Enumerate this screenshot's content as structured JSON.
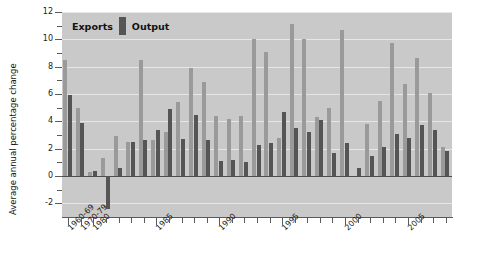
{
  "chart_data": {
    "type": "bar",
    "title": "",
    "xlabel": "",
    "ylabel": "Average annual percentage change",
    "ylim": [
      -3,
      12
    ],
    "yticks": [
      -2,
      0,
      2,
      4,
      6,
      8,
      10,
      12
    ],
    "ytick_labels": [
      "-2",
      "0",
      "2",
      "4",
      "6",
      "8",
      "10",
      "12"
    ],
    "grid": true,
    "legend_position": "top-left",
    "legend": [
      "Exports",
      "Output"
    ],
    "categories": [
      "1960-69",
      "1970-79",
      "1980",
      "1981",
      "1982",
      "1983",
      "1984",
      "1985",
      "1986",
      "1987",
      "1988",
      "1989",
      "1990",
      "1991",
      "1992",
      "1993",
      "1994",
      "1995",
      "1996",
      "1997",
      "1998",
      "1999",
      "2000",
      "2001",
      "2002",
      "2003",
      "2004",
      "2005",
      "2006",
      "2007",
      "2008"
    ],
    "tick_label_categories": [
      "1960-69",
      "1970-79",
      "1980",
      "1985",
      "1990",
      "1995",
      "2000",
      "2005"
    ],
    "series": [
      {
        "name": "Exports",
        "color": "#9a9a9a",
        "values": [
          8.5,
          5.0,
          0.3,
          1.3,
          2.9,
          2.5,
          8.5,
          2.6,
          3.2,
          5.4,
          7.9,
          6.9,
          4.4,
          4.2,
          4.4,
          10.0,
          9.1,
          2.8,
          11.1,
          10.0,
          4.3,
          5.0,
          10.7,
          0.0,
          3.8,
          5.5,
          9.7,
          6.7,
          8.6,
          6.1,
          2.1
        ]
      },
      {
        "name": "Output",
        "color": "#555555",
        "values": [
          5.9,
          3.85,
          0.4,
          -2.4,
          0.6,
          2.5,
          2.6,
          3.4,
          4.9,
          2.7,
          4.5,
          2.6,
          1.1,
          1.2,
          1.0,
          2.3,
          2.4,
          4.7,
          3.5,
          3.2,
          4.1,
          1.7,
          2.4,
          0.6,
          1.5,
          2.1,
          3.1,
          2.8,
          3.7,
          3.4,
          1.8
        ]
      }
    ]
  },
  "legend": {
    "exports_label": "Exports",
    "output_label": "Output"
  },
  "axes": {
    "y_title": "Average annual percentage change"
  }
}
